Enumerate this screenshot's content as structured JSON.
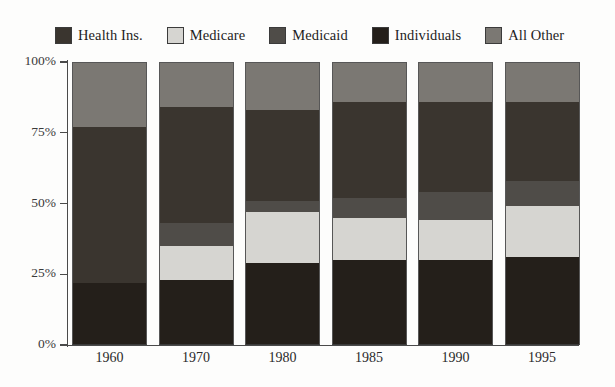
{
  "legend": {
    "items": [
      {
        "label": "Health Ins.",
        "color": "#3a352f",
        "key": "health_ins"
      },
      {
        "label": "Medicare",
        "color": "#d6d5d1",
        "key": "medicare"
      },
      {
        "label": "Medicaid",
        "color": "#4f4c48",
        "key": "medicaid"
      },
      {
        "label": "Individuals",
        "color": "#241f1a",
        "key": "individuals"
      },
      {
        "label": "All Other",
        "color": "#7b7873",
        "key": "all_other"
      }
    ]
  },
  "axes": {
    "y_ticks": [
      "100%",
      "75%",
      "50%",
      "25%",
      "0%"
    ],
    "y_tick_values": [
      100,
      75,
      50,
      25,
      0
    ],
    "x_ticks": [
      "1960",
      "1970",
      "1980",
      "1985",
      "1990",
      "1995"
    ]
  },
  "chart_data": {
    "type": "bar",
    "title": "",
    "subtitle": "",
    "xlabel": "",
    "ylabel": "",
    "ylim": [
      0,
      100
    ],
    "grid": false,
    "stacked": true,
    "stack_order_bottom_to_top": [
      "Individuals",
      "Medicare",
      "Medicaid",
      "Health Ins.",
      "All Other"
    ],
    "legend_position": "top",
    "categories": [
      "1960",
      "1970",
      "1980",
      "1985",
      "1990",
      "1995"
    ],
    "series": [
      {
        "name": "Individuals",
        "color": "#241f1a",
        "values": [
          22,
          23,
          29,
          30,
          30,
          31
        ]
      },
      {
        "name": "Medicare",
        "color": "#d6d5d1",
        "values": [
          0,
          12,
          18,
          15,
          14,
          18
        ]
      },
      {
        "name": "Medicaid",
        "color": "#4f4c48",
        "values": [
          0,
          8,
          4,
          7,
          10,
          9
        ]
      },
      {
        "name": "Health Ins.",
        "color": "#3a352f",
        "values": [
          55,
          41,
          32,
          34,
          32,
          28
        ]
      },
      {
        "name": "All Other",
        "color": "#7b7873",
        "values": [
          23,
          16,
          17,
          14,
          14,
          14
        ]
      }
    ],
    "annotations": []
  }
}
